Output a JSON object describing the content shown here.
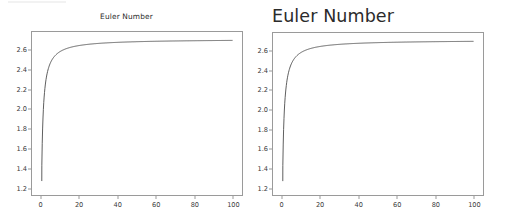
{
  "figure": {
    "background": "#ffffff",
    "axis_color": "#9a9a9a",
    "line_color": "#4d4d4d",
    "tick_label_color": "#3a3a3a",
    "title_color": "#2b2b2b"
  },
  "panels": [
    {
      "id": "left",
      "title": "Euler Number",
      "title_size": "small",
      "title_align": "center"
    },
    {
      "id": "right",
      "title": "Euler Number",
      "title_size": "large",
      "title_align": "left"
    }
  ],
  "chart_data": [
    {
      "type": "line",
      "title": "Euler Number",
      "xlabel": "",
      "ylabel": "",
      "xlim": [
        -4.95,
        104.95
      ],
      "ylim": [
        1.1275,
        2.7905
      ],
      "xticks": [
        0,
        20,
        40,
        60,
        80,
        100
      ],
      "yticks": [
        1.2,
        1.4,
        1.6,
        1.8,
        2.0,
        2.2,
        2.4,
        2.6
      ],
      "xticklabels": [
        "0",
        "20",
        "40",
        "60",
        "80",
        "100"
      ],
      "yticklabels": [
        "1.2",
        "1.4",
        "1.6",
        "1.8",
        "2.0",
        "2.2",
        "2.4",
        "2.6"
      ],
      "grid": false,
      "legend": false,
      "series": [
        {
          "name": "(1 + 1/n)^n",
          "x": [
            1,
            2,
            3,
            4,
            5,
            6,
            7,
            8,
            9,
            10,
            12,
            14,
            16,
            18,
            20,
            25,
            30,
            35,
            40,
            45,
            50,
            55,
            60,
            65,
            70,
            75,
            80,
            85,
            90,
            95,
            100
          ],
          "y": [
            2.0,
            2.25,
            2.3704,
            2.4414,
            2.4883,
            2.5216,
            2.5465,
            2.5658,
            2.5812,
            2.5937,
            2.6127,
            2.6264,
            2.6367,
            2.6448,
            2.6533,
            2.6658,
            2.6743,
            2.6805,
            2.6851,
            2.6887,
            2.6916,
            2.694,
            2.696,
            2.6976,
            2.6991,
            2.7003,
            2.7014,
            2.7023,
            2.7032,
            2.7039,
            2.7048
          ]
        }
      ],
      "curve_start_y": 1.27,
      "asymptote": 2.71828
    },
    {
      "type": "line",
      "title": "Euler Number",
      "xlabel": "",
      "ylabel": "",
      "xlim": [
        -4.95,
        104.95
      ],
      "ylim": [
        1.1275,
        2.7905
      ],
      "xticks": [
        0,
        20,
        40,
        60,
        80,
        100
      ],
      "yticks": [
        1.2,
        1.4,
        1.6,
        1.8,
        2.0,
        2.2,
        2.4,
        2.6
      ],
      "xticklabels": [
        "0",
        "20",
        "40",
        "60",
        "80",
        "100"
      ],
      "yticklabels": [
        "1.2",
        "1.4",
        "1.6",
        "1.8",
        "2.0",
        "2.2",
        "2.4",
        "2.6"
      ],
      "grid": false,
      "legend": false,
      "series": [
        {
          "name": "(1 + 1/n)^n",
          "x": [
            1,
            2,
            3,
            4,
            5,
            6,
            7,
            8,
            9,
            10,
            12,
            14,
            16,
            18,
            20,
            25,
            30,
            35,
            40,
            45,
            50,
            55,
            60,
            65,
            70,
            75,
            80,
            85,
            90,
            95,
            100
          ],
          "y": [
            2.0,
            2.25,
            2.3704,
            2.4414,
            2.4883,
            2.5216,
            2.5465,
            2.5658,
            2.5812,
            2.5937,
            2.6127,
            2.6264,
            2.6367,
            2.6448,
            2.6533,
            2.6658,
            2.6743,
            2.6805,
            2.6851,
            2.6887,
            2.6916,
            2.694,
            2.696,
            2.6976,
            2.6991,
            2.7003,
            2.7014,
            2.7023,
            2.7032,
            2.7039,
            2.7048
          ]
        }
      ],
      "curve_start_y": 1.27,
      "asymptote": 2.71828
    }
  ]
}
